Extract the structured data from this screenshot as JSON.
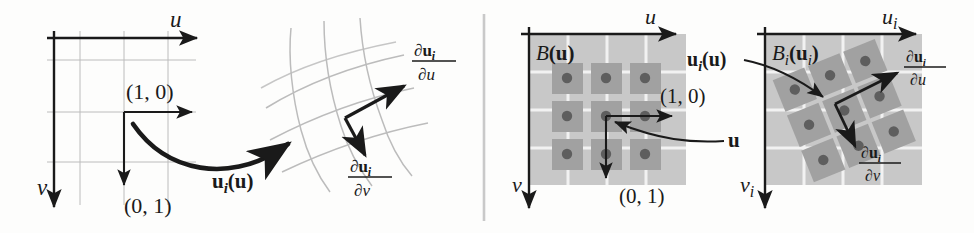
{
  "figure": {
    "panel_divider_color": "#c9c9c9",
    "colors": {
      "ink": "#1a1a1a",
      "grid_light": "#b9b9b9",
      "block_light": "#c8c8c8",
      "block_dark": "#a1a1a1",
      "dot": "#5e5e5e",
      "white_grid": "#f2f2f2"
    }
  },
  "left_panel": {
    "name": "smooth-mapping-panel",
    "axis_u_label": "u",
    "axis_v_label": "v",
    "basis_vector_u_label": "(1, 0)",
    "basis_vector_v_label": "(0, 1)",
    "mapping_label": "u",
    "mapping_label_sub": "i",
    "mapping_label_arg": "(u)",
    "deriv_u_numerator": "∂u",
    "deriv_u_numerator_sub": "i",
    "deriv_u_denominator": "∂u",
    "deriv_v_numerator": "∂u",
    "deriv_v_numerator_sub": "i",
    "deriv_v_denominator": "∂v"
  },
  "right_panel": {
    "name": "discrete-block-panel",
    "source": {
      "name": "source-block-diagram",
      "axis_u_label": "u",
      "axis_v_label": "v",
      "block_label": "B",
      "block_label_arg": "(u)",
      "basis_vector_u_label": "(1, 0)",
      "basis_vector_v_label": "(0, 1)",
      "point_label": "u",
      "grid_rows": 3,
      "grid_cols": 3,
      "dot_count": 9
    },
    "mapping_label": "u",
    "mapping_label_sub": "i",
    "mapping_label_arg": "(u)",
    "target": {
      "name": "target-block-diagram",
      "axis_u_label": "u",
      "axis_u_label_sub": "i",
      "axis_v_label": "v",
      "axis_v_label_sub": "i",
      "block_label": "B",
      "block_label_sub": "i",
      "block_label_arg": "(u",
      "block_label_arg_sub": "i",
      "block_label_arg_close": ")",
      "deriv_u_numerator": "∂u",
      "deriv_u_numerator_sub": "i",
      "deriv_u_denominator": "∂u",
      "deriv_v_numerator": "∂u",
      "deriv_v_numerator_sub": "i",
      "deriv_v_denominator": "∂v",
      "grid_rows": 3,
      "grid_cols": 3,
      "rotation_degrees": -22,
      "dot_count": 9
    }
  }
}
